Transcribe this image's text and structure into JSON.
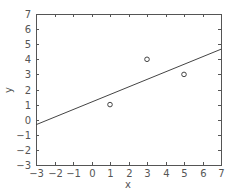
{
  "chart_data": {
    "type": "scatter",
    "title": "",
    "xlabel": "x",
    "ylabel": "y",
    "xlim": [
      -3,
      7
    ],
    "ylim": [
      -3,
      7
    ],
    "xticks": [
      -3,
      -2,
      -1,
      0,
      1,
      2,
      3,
      4,
      5,
      6,
      7
    ],
    "yticks": [
      -3,
      -2,
      -1,
      0,
      1,
      2,
      3,
      4,
      5,
      6,
      7
    ],
    "grid": false,
    "series": [
      {
        "name": "data points",
        "type": "scatter",
        "marker": "circle-open",
        "x": [
          1,
          3,
          5
        ],
        "y": [
          1,
          4,
          3
        ]
      },
      {
        "name": "least-squares fit",
        "type": "line",
        "x": [
          -3,
          7
        ],
        "y": [
          -0.333,
          4.667
        ],
        "slope": 0.5,
        "intercept": 1.1667
      }
    ]
  },
  "colors": {
    "axis": "#555555",
    "line": "#444444",
    "marker": "#444444",
    "background": "#ffffff"
  },
  "layout": {
    "plot_left": 36,
    "plot_right": 221,
    "plot_top": 14,
    "plot_bottom": 165
  }
}
